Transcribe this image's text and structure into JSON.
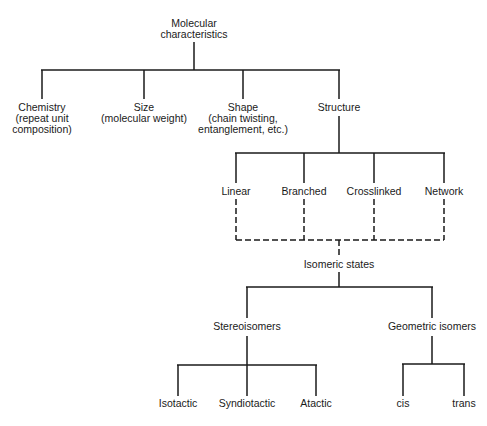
{
  "diagram": {
    "root": {
      "line1": "Molecular",
      "line2": "characteristics"
    },
    "level1": {
      "chemistry": {
        "line1": "Chemistry",
        "line2": "(repeat unit",
        "line3": "composition)"
      },
      "size": {
        "line1": "Size",
        "line2": "(molecular weight)"
      },
      "shape": {
        "line1": "Shape",
        "line2": "(chain twisting,",
        "line3": "entanglement, etc.)"
      },
      "structure": {
        "line1": "Structure"
      }
    },
    "structure_children": {
      "linear": "Linear",
      "branched": "Branched",
      "crosslinked": "Crosslinked",
      "network": "Network"
    },
    "isomeric_states": "Isomeric states",
    "isomer_types": {
      "stereoisomers": "Stereoisomers",
      "geometric": "Geometric isomers"
    },
    "stereo_children": {
      "isotactic": "Isotactic",
      "syndiotactic": "Syndiotactic",
      "atactic": "Atactic"
    },
    "geometric_children": {
      "cis": "cis",
      "trans": "trans"
    },
    "line_color": "#1a1a1a",
    "connector_styles": {
      "structure_to_isomeric": "dashed",
      "others": "solid"
    }
  }
}
